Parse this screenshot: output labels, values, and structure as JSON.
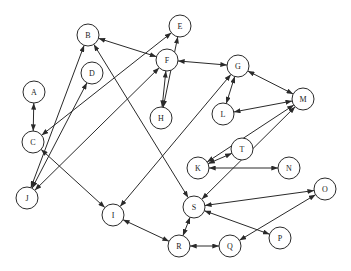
{
  "diagram": {
    "type": "directed-graph",
    "node_radius": 11,
    "colors": {
      "background": "#ffffff",
      "stroke": "#2a2a2a",
      "label": "#222222"
    },
    "nodes": [
      {
        "id": "A",
        "label": "A",
        "x": 34,
        "y": 92
      },
      {
        "id": "B",
        "label": "B",
        "x": 88,
        "y": 35
      },
      {
        "id": "C",
        "label": "C",
        "x": 33,
        "y": 142
      },
      {
        "id": "D",
        "label": "D",
        "x": 92,
        "y": 73
      },
      {
        "id": "E",
        "label": "E",
        "x": 180,
        "y": 26
      },
      {
        "id": "F",
        "label": "F",
        "x": 167,
        "y": 60
      },
      {
        "id": "G",
        "label": "G",
        "x": 238,
        "y": 66
      },
      {
        "id": "H",
        "label": "H",
        "x": 161,
        "y": 118
      },
      {
        "id": "I",
        "label": "I",
        "x": 113,
        "y": 215
      },
      {
        "id": "J",
        "label": "J",
        "x": 27,
        "y": 198
      },
      {
        "id": "K",
        "label": "K",
        "x": 198,
        "y": 168
      },
      {
        "id": "L",
        "label": "L",
        "x": 223,
        "y": 114
      },
      {
        "id": "M",
        "label": "M",
        "x": 303,
        "y": 99
      },
      {
        "id": "N",
        "label": "N",
        "x": 289,
        "y": 168
      },
      {
        "id": "O",
        "label": "O",
        "x": 325,
        "y": 189
      },
      {
        "id": "P",
        "label": "P",
        "x": 280,
        "y": 238
      },
      {
        "id": "Q",
        "label": "Q",
        "x": 230,
        "y": 246
      },
      {
        "id": "R",
        "label": "R",
        "x": 179,
        "y": 246
      },
      {
        "id": "S",
        "label": "S",
        "x": 194,
        "y": 207
      },
      {
        "id": "T",
        "label": "T",
        "x": 242,
        "y": 149
      }
    ],
    "edges": [
      {
        "from": "A",
        "to": "C",
        "bidirectional": true
      },
      {
        "from": "B",
        "to": "F",
        "bidirectional": true
      },
      {
        "from": "B",
        "to": "J",
        "bidirectional": true
      },
      {
        "from": "B",
        "to": "S",
        "bidirectional": true
      },
      {
        "from": "C",
        "to": "E",
        "bidirectional": true
      },
      {
        "from": "C",
        "to": "I",
        "bidirectional": true
      },
      {
        "from": "D",
        "to": "J",
        "bidirectional": true
      },
      {
        "from": "E",
        "to": "H",
        "bidirectional": true
      },
      {
        "from": "F",
        "to": "H",
        "bidirectional": true
      },
      {
        "from": "F",
        "to": "G",
        "bidirectional": true
      },
      {
        "from": "F",
        "to": "J",
        "bidirectional": true
      },
      {
        "from": "G",
        "to": "I",
        "bidirectional": true
      },
      {
        "from": "G",
        "to": "L",
        "bidirectional": true
      },
      {
        "from": "G",
        "to": "M",
        "bidirectional": true
      },
      {
        "from": "L",
        "to": "M",
        "bidirectional": true
      },
      {
        "from": "M",
        "to": "K",
        "bidirectional": true
      },
      {
        "from": "M",
        "to": "S",
        "bidirectional": true
      },
      {
        "from": "K",
        "to": "T",
        "bidirectional": true
      },
      {
        "from": "K",
        "to": "N",
        "bidirectional": true
      },
      {
        "from": "S",
        "to": "O",
        "bidirectional": true
      },
      {
        "from": "S",
        "to": "P",
        "bidirectional": true
      },
      {
        "from": "O",
        "to": "Q",
        "bidirectional": true
      },
      {
        "from": "S",
        "to": "R",
        "bidirectional": true
      },
      {
        "from": "R",
        "to": "Q",
        "bidirectional": true
      },
      {
        "from": "I",
        "to": "R",
        "bidirectional": true
      }
    ]
  }
}
